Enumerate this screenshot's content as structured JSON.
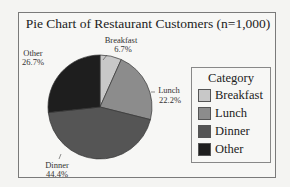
{
  "title": "Pie Chart of Restaurant Customers (n=1,000)",
  "legend": {
    "title": "Category",
    "items": [
      {
        "label": "Breakfast",
        "color": "#c8c8c8"
      },
      {
        "label": "Lunch",
        "color": "#8c8c8c"
      },
      {
        "label": "Dinner",
        "color": "#555555"
      },
      {
        "label": "Other",
        "color": "#1e1e1e"
      }
    ]
  },
  "slice_labels": [
    {
      "name": "Breakfast",
      "pct": "6.7%"
    },
    {
      "name": "Lunch",
      "pct": "22.2%"
    },
    {
      "name": "Dinner",
      "pct": "44.4%"
    },
    {
      "name": "Other",
      "pct": "26.7%"
    }
  ],
  "chart_data": {
    "type": "pie",
    "title": "Pie Chart of Restaurant Customers (n=1,000)",
    "categories": [
      "Breakfast",
      "Lunch",
      "Dinner",
      "Other"
    ],
    "values": [
      6.7,
      22.2,
      44.4,
      26.7
    ],
    "colors": [
      "#c8c8c8",
      "#8c8c8c",
      "#555555",
      "#1e1e1e"
    ],
    "legend_title": "Category",
    "legend_position": "right"
  }
}
